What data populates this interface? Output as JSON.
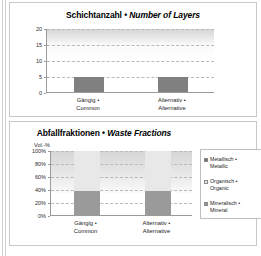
{
  "panels": {
    "top": {
      "title_de": "Schichtanzahl",
      "title_sep": " • ",
      "title_en": "Number of Layers"
    },
    "bottom": {
      "title_de": "Abfallfraktionen",
      "title_sep": " • ",
      "title_en": "Waste Fractions"
    }
  },
  "categories": [
    {
      "de": "Gängig •",
      "en": "Common"
    },
    {
      "de": "Alternativ •",
      "en": "Alternative"
    }
  ],
  "colors": {
    "bar_gray": "#808080",
    "metallic": "#6e6e6e",
    "organic": "#e8e8e8",
    "mineral": "#9a9a9a",
    "axis": "#9a9a9a",
    "grid": "#b9b9b9",
    "panel_border": "#c8c8c8"
  },
  "chart_data": [
    {
      "type": "bar",
      "title": "Schichtanzahl • Number of Layers",
      "xlabel": "",
      "ylabel": "",
      "categories": [
        "Gängig • Common",
        "Alternativ • Alternative"
      ],
      "values": [
        5,
        5
      ],
      "ylim": [
        0,
        20
      ],
      "yticks": [
        0,
        5,
        10,
        15,
        20
      ],
      "ytick_labels": [
        "0",
        "5",
        "10",
        "15",
        "20"
      ],
      "grid": true,
      "legend": "none"
    },
    {
      "type": "bar",
      "subtype": "stacked-100",
      "title": "Abfallfraktionen • Waste Fractions",
      "xlabel": "",
      "ylabel": "Vol.-%",
      "categories": [
        "Gängig • Common",
        "Alternativ • Alternative"
      ],
      "ylim": [
        0,
        100
      ],
      "yticks": [
        0,
        20,
        40,
        60,
        80,
        100
      ],
      "ytick_labels": [
        "0%",
        "20%",
        "40%",
        "60%",
        "80%",
        "100%"
      ],
      "grid": true,
      "legend": "right",
      "series": [
        {
          "name": "Metallisch • Metallic",
          "values": [
            0,
            0
          ]
        },
        {
          "name": "Organisch • Organic",
          "values": [
            62,
            61
          ]
        },
        {
          "name": "Mineralisch • Mineral",
          "values": [
            38,
            39
          ]
        }
      ]
    }
  ],
  "top_chart": {
    "yticks": [
      {
        "label": "20",
        "value": 20
      },
      {
        "label": "15",
        "value": 15
      },
      {
        "label": "10",
        "value": 10
      },
      {
        "label": "5",
        "value": 5
      },
      {
        "label": "0",
        "value": 0
      }
    ],
    "bars": [
      {
        "label": "Gängig • Common",
        "value": 5
      },
      {
        "label": "Alternativ • Alternative",
        "value": 5
      }
    ]
  },
  "bottom_chart": {
    "unit": "Vol.-%",
    "yticks": [
      {
        "label": "100%",
        "value": 100
      },
      {
        "label": "80%",
        "value": 80
      },
      {
        "label": "60%",
        "value": 60
      },
      {
        "label": "40%",
        "value": 40
      },
      {
        "label": "20%",
        "value": 20
      },
      {
        "label": "0%",
        "value": 0
      }
    ],
    "legend": [
      {
        "de": "Metallisch •",
        "en": "Metallic"
      },
      {
        "de": "Organisch •",
        "en": "Organic"
      },
      {
        "de": "Mineralisch •",
        "en": "Mineral"
      }
    ]
  }
}
